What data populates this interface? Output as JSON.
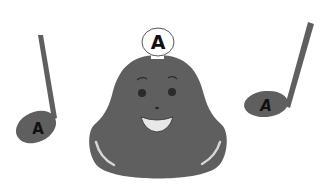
{
  "scene": {
    "description": "Smiling bell character with two music notes",
    "bell": {
      "label": "A",
      "color": "#5f5f5f",
      "face": {
        "eye_color": "#2a2a2a",
        "mouth_color": "#e8e8e8"
      }
    },
    "notes": [
      {
        "side": "left",
        "label": "A",
        "color": "#5f5f5f"
      },
      {
        "side": "right",
        "label": "A",
        "color": "#5f5f5f"
      }
    ]
  }
}
